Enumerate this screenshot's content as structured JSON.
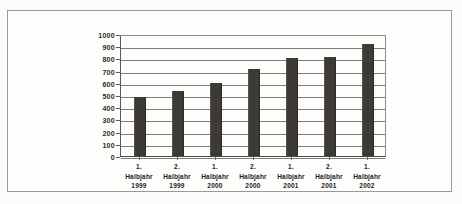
{
  "figure": {
    "frame_color": "#9a9a96",
    "background_color": "#fdfcfa"
  },
  "chart_data": {
    "type": "bar",
    "title": "",
    "subtitle": "",
    "xlabel": "",
    "ylabel": "",
    "categories": [
      "1. Halbjahr 1999",
      "2. Halbjahr 1999",
      "1. Halbjahr 2000",
      "2. Halbjahr 2000",
      "1. Halbjahr 2001",
      "2. Halbjahr 2001",
      "1. Halbjahr 2002"
    ],
    "category_lines": [
      [
        "1.",
        "Halbjahr",
        "1999"
      ],
      [
        "2.",
        "Halbjahr",
        "1999"
      ],
      [
        "1.",
        "Halbjahr",
        "2000"
      ],
      [
        "2.",
        "Halbjahr",
        "2000"
      ],
      [
        "1.",
        "Halbjahr",
        "2001"
      ],
      [
        "2.",
        "Halbjahr",
        "2001"
      ],
      [
        "1.",
        "Halbjahr",
        "2002"
      ]
    ],
    "values": [
      485,
      530,
      600,
      715,
      805,
      815,
      920
    ],
    "ylim": [
      0,
      1000
    ],
    "ytick_step": 100,
    "ytick_labels": [
      "1000",
      "900",
      "800",
      "700",
      "600",
      "500",
      "400",
      "300",
      "200",
      "100",
      "0"
    ],
    "grid": "horizontal",
    "legend": "none",
    "bar_color": "#3d3a36",
    "axis_color": "#5a5a58",
    "gridline_color": "#7e7e7b"
  }
}
